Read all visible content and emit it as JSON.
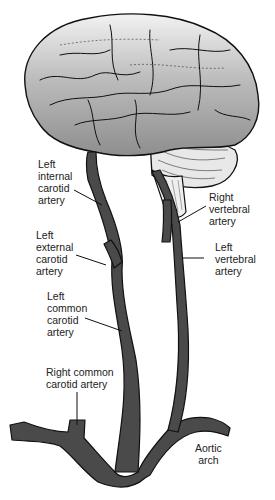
{
  "diagram": {
    "colors": {
      "vessel_fill": "#4a4a4a",
      "vessel_outline": "#111111",
      "brain_fill": "#b8b8b8",
      "cerebellum_fill": "#e6e6e6",
      "leader_line": "#111111"
    },
    "labels": {
      "left_internal_carotid": "Left\ninternal\ncarotid\nartery",
      "right_vertebral": "Right\nvertebral\nartery",
      "left_external_carotid": "Left\nexternal\ncarotid\nartery",
      "left_vertebral": "Left\nvertebral\nartery",
      "left_common_carotid": "Left\ncommon\ncarotid\nartery",
      "right_common_carotid": "Right common\ncarotid artery",
      "aortic_arch": "Aortic\narch"
    }
  }
}
